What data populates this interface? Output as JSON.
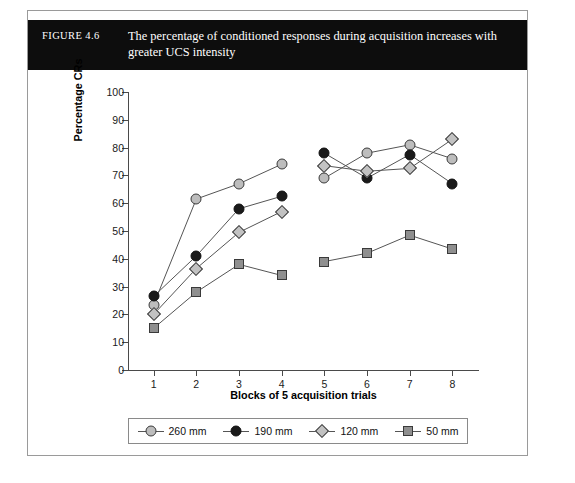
{
  "figure": {
    "number": "FIGURE 4.6",
    "caption": "The percentage of conditioned responses during acquisition increases with greater UCS intensity"
  },
  "chart_data": {
    "type": "line",
    "title": "The percentage of conditioned responses during acquisition increases with greater UCS intensity",
    "xlabel": "Blocks of 5 acquisition trials",
    "ylabel": "Percentage CRs",
    "categories": [
      "1",
      "2",
      "3",
      "4",
      "5",
      "6",
      "7",
      "8"
    ],
    "x": [
      1,
      2,
      3,
      4,
      5,
      6,
      7,
      8
    ],
    "xlim": [
      0.4,
      8.6
    ],
    "ylim": [
      0,
      100
    ],
    "yticks": [
      0,
      10,
      20,
      30,
      40,
      50,
      60,
      70,
      80,
      90,
      100
    ],
    "xticks": [
      1,
      2,
      3,
      4,
      5,
      6,
      7,
      8
    ],
    "grid": false,
    "legend_position": "bottom",
    "gap_between": "4 and 5",
    "series": [
      {
        "name": "260 mm",
        "marker": "circle",
        "color": "#bdbdbd",
        "edge_color": "#3a3a3a",
        "values": [
          23.5,
          61.5,
          67.0,
          74.0,
          69.0,
          78.0,
          81.0,
          76.0
        ]
      },
      {
        "name": "190 mm",
        "marker": "circle",
        "color": "#1a1a1a",
        "edge_color": "#111111",
        "values": [
          26.5,
          41.0,
          58.0,
          62.5,
          78.0,
          69.0,
          77.5,
          67.0
        ]
      },
      {
        "name": "120 mm",
        "marker": "diamond",
        "color": "#c2c2c2",
        "edge_color": "#3a3a3a",
        "values": [
          20.0,
          36.5,
          49.5,
          57.0,
          73.5,
          71.5,
          72.5,
          83.0
        ]
      },
      {
        "name": "50 mm",
        "marker": "square",
        "color": "#8f8f8f",
        "edge_color": "#3a3a3a",
        "values": [
          15.0,
          28.0,
          38.0,
          34.0,
          39.0,
          42.0,
          48.5,
          43.5
        ]
      }
    ]
  },
  "legend": {
    "items": [
      {
        "label": "260 mm"
      },
      {
        "label": "190 mm"
      },
      {
        "label": "120 mm"
      },
      {
        "label": "50 mm"
      }
    ]
  }
}
